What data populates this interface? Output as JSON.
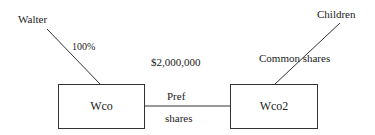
{
  "diagram": {
    "nodes": {
      "walter": "Walter",
      "children": "Children",
      "wco": "Wco",
      "wco2": "Wco2"
    },
    "edges": {
      "walter_wco_label": "100%",
      "children_wco2_label": "Common shares",
      "wco_wco2_amount": "$2,000,000",
      "wco_wco2_label_line1": "Pref",
      "wco_wco2_label_line2": "shares"
    }
  }
}
